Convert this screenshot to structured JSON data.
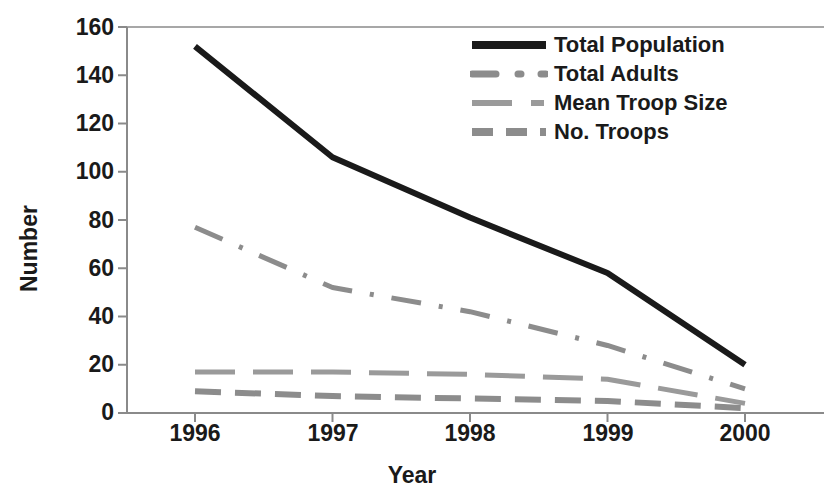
{
  "chart_data": {
    "type": "line",
    "title": "",
    "xlabel": "Year",
    "ylabel": "Number",
    "categories": [
      "1996",
      "1997",
      "1998",
      "1999",
      "2000"
    ],
    "x": [
      1996,
      1997,
      1998,
      1999,
      2000
    ],
    "xlim": [
      1996,
      2000
    ],
    "ylim": [
      0,
      160
    ],
    "y_ticks": [
      0,
      20,
      40,
      60,
      80,
      100,
      120,
      140,
      160
    ],
    "x_ticks": [
      "1996",
      "1997",
      "1998",
      "1999",
      "2000"
    ],
    "grid": false,
    "legend_position": "top-right",
    "series": [
      {
        "name": "Total Population",
        "values": [
          152,
          106,
          81,
          58,
          20
        ],
        "color": "#1a1a1a",
        "style": "solid",
        "width": 6
      },
      {
        "name": "Total Adults",
        "values": [
          77,
          52,
          42,
          28,
          10
        ],
        "color": "#8c8c8c",
        "style": "dash-dot",
        "width": 5
      },
      {
        "name": "Mean Troop Size",
        "values": [
          17,
          17,
          16,
          14,
          4
        ],
        "color": "#9a9a9a",
        "style": "long-dash",
        "width": 5
      },
      {
        "name": "No. Troops",
        "values": [
          9,
          7,
          6,
          5,
          2
        ],
        "color": "#8c8c8c",
        "style": "dashed",
        "width": 6
      }
    ]
  },
  "axis": {
    "y_title": "Number",
    "x_title": "Year",
    "y_tick_labels": {
      "t160": "160",
      "t140": "140",
      "t120": "120",
      "t100": "100",
      "t80": "80",
      "t60": "60",
      "t40": "40",
      "t20": "20",
      "t0": "0"
    },
    "x_tick_labels": {
      "x1996": "1996",
      "x1997": "1997",
      "x1998": "1998",
      "x1999": "1999",
      "x2000": "2000"
    }
  },
  "legend": {
    "items": [
      {
        "label": "Total Population"
      },
      {
        "label": "Total Adults"
      },
      {
        "label": "Mean Troop Size"
      },
      {
        "label": "No. Troops"
      }
    ]
  },
  "colors": {
    "ink": "#1a1a1a",
    "axis": "#7a7a7a",
    "series_gray": "#8c8c8c",
    "background": "#ffffff"
  }
}
